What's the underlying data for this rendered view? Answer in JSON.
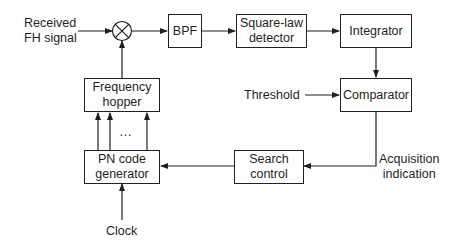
{
  "diagram": {
    "type": "block-diagram",
    "title": "",
    "colors": {
      "stroke": "#231f20",
      "background": "#ffffff"
    },
    "inputs": {
      "received_signal": "Received\nFH signal",
      "threshold": "Threshold",
      "clock": "Clock"
    },
    "outputs": {
      "acquisition": "Acquisition\nindication"
    },
    "mixer": {
      "symbol": "multiplier-circle"
    },
    "blocks": {
      "bpf": "BPF",
      "square_law": "Square-law\ndetector",
      "integrator": "Integrator",
      "comparator": "Comparator",
      "frequency_hopper": "Frequency\nhopper",
      "pn_generator": "PN code\ngenerator",
      "search_control": "Search\ncontrol"
    },
    "ellipsis": "…",
    "edges": [
      [
        "Received FH signal",
        "mixer"
      ],
      [
        "mixer",
        "BPF"
      ],
      [
        "BPF",
        "Square-law detector"
      ],
      [
        "Square-law detector",
        "Integrator"
      ],
      [
        "Integrator",
        "Comparator"
      ],
      [
        "Threshold",
        "Comparator"
      ],
      [
        "Comparator",
        "Search control"
      ],
      [
        "Search control",
        "PN code generator"
      ],
      [
        "Clock",
        "PN code generator"
      ],
      [
        "PN code generator",
        "Frequency hopper"
      ],
      [
        "Frequency hopper",
        "mixer"
      ]
    ]
  }
}
